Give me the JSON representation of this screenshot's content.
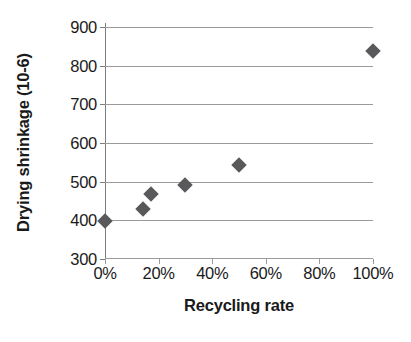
{
  "chart_data": {
    "type": "scatter",
    "title": "",
    "xlabel": "Recycling rate",
    "ylabel": "Drying shrinkage (10-6)",
    "xlim": [
      0,
      100
    ],
    "ylim": [
      300,
      900
    ],
    "grid": true,
    "legend": "none",
    "marker": {
      "shape": "diamond",
      "color": "#59595b",
      "size": 11
    },
    "xticks": [
      {
        "value": 0,
        "label": "0%"
      },
      {
        "value": 20,
        "label": "20%"
      },
      {
        "value": 40,
        "label": "40%"
      },
      {
        "value": 60,
        "label": "60%"
      },
      {
        "value": 80,
        "label": "80%"
      },
      {
        "value": 100,
        "label": "100%"
      }
    ],
    "yticks": [
      {
        "value": 900,
        "label": "900"
      },
      {
        "value": 800,
        "label": "800"
      },
      {
        "value": 700,
        "label": "700"
      },
      {
        "value": 600,
        "label": "600"
      },
      {
        "value": 500,
        "label": "500"
      },
      {
        "value": 400,
        "label": "400"
      },
      {
        "value": 300,
        "label": "300"
      }
    ],
    "points": [
      {
        "x": 0,
        "y": 397
      },
      {
        "x": 14,
        "y": 430
      },
      {
        "x": 17,
        "y": 468
      },
      {
        "x": 30,
        "y": 492
      },
      {
        "x": 50,
        "y": 543
      },
      {
        "x": 100,
        "y": 838
      }
    ]
  }
}
